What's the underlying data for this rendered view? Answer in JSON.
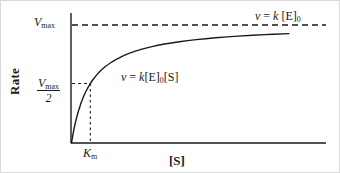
{
  "figure": {
    "kind": "michaelis-menten-saturation-plot",
    "background_color": "#ffffff",
    "ink_color": "#1a1a1a",
    "border_color": "#d9d9d9"
  },
  "axes": {
    "y_title": "Rate",
    "x_title": "[S]",
    "y_tick_labels": [
      {
        "name": "vmax",
        "numerator": "V",
        "numerator_sub": "max",
        "denominator": null
      },
      {
        "name": "vmax-half",
        "numerator": "V",
        "numerator_sub": "max",
        "denominator": "2"
      }
    ],
    "x_tick_labels": [
      {
        "name": "km",
        "symbol": "K",
        "sub": "m"
      }
    ]
  },
  "annotations": {
    "curve_equation": {
      "v": "v",
      "equals": "=",
      "k": "k",
      "enzyme": "[E]",
      "enzyme_sub": "0",
      "substrate": "[S]"
    },
    "asymptote_equation": {
      "v": "v",
      "equals": "=",
      "k": "k",
      "enzyme": "[E]",
      "enzyme_sub": "0"
    }
  },
  "chart_data": {
    "type": "line",
    "title": "",
    "xlabel": "[S]",
    "ylabel": "Rate",
    "xlim": [
      0,
      1
    ],
    "ylim": [
      0,
      1
    ],
    "grid": false,
    "legend": "none",
    "model": "v = Vmax * [S] / (Km + [S])",
    "parameters": {
      "Vmax_normalized": 1.0,
      "Km_normalized": 0.0865,
      "half_max_normalized": 0.5
    },
    "reference_lines": [
      {
        "name": "vmax-asymptote",
        "orientation": "horizontal",
        "style": "dashed",
        "y_value": 1.0,
        "label": "Vmax"
      },
      {
        "name": "km-dropline",
        "orientation": "vertical",
        "style": "dotted",
        "x_value": 0.0865,
        "label": "Km"
      },
      {
        "name": "half-max-connector",
        "orientation": "horizontal",
        "style": "dashed",
        "y_value": 0.5,
        "label": "Vmax/2"
      }
    ],
    "series": [
      {
        "name": "rate-vs-substrate",
        "style": "solid",
        "points": [
          [
            0.0,
            0.0
          ],
          [
            0.004,
            0.044
          ],
          [
            0.008,
            0.085
          ],
          [
            0.012,
            0.122
          ],
          [
            0.017,
            0.164
          ],
          [
            0.021,
            0.195
          ],
          [
            0.026,
            0.231
          ],
          [
            0.031,
            0.263
          ],
          [
            0.037,
            0.296
          ],
          [
            0.043,
            0.332
          ],
          [
            0.049,
            0.361
          ],
          [
            0.057,
            0.397
          ],
          [
            0.065,
            0.429
          ],
          [
            0.074,
            0.46
          ],
          [
            0.086,
            0.5
          ],
          [
            0.1,
            0.536
          ],
          [
            0.117,
            0.575
          ],
          [
            0.135,
            0.609
          ],
          [
            0.156,
            0.643
          ],
          [
            0.18,
            0.675
          ],
          [
            0.208,
            0.706
          ],
          [
            0.24,
            0.735
          ],
          [
            0.277,
            0.762
          ],
          [
            0.32,
            0.787
          ],
          [
            0.37,
            0.811
          ],
          [
            0.428,
            0.832
          ],
          [
            0.495,
            0.851
          ],
          [
            0.573,
            0.869
          ],
          [
            0.663,
            0.885
          ],
          [
            0.767,
            0.899
          ],
          [
            0.888,
            0.911
          ],
          [
            1.0,
            0.92
          ]
        ]
      }
    ]
  }
}
